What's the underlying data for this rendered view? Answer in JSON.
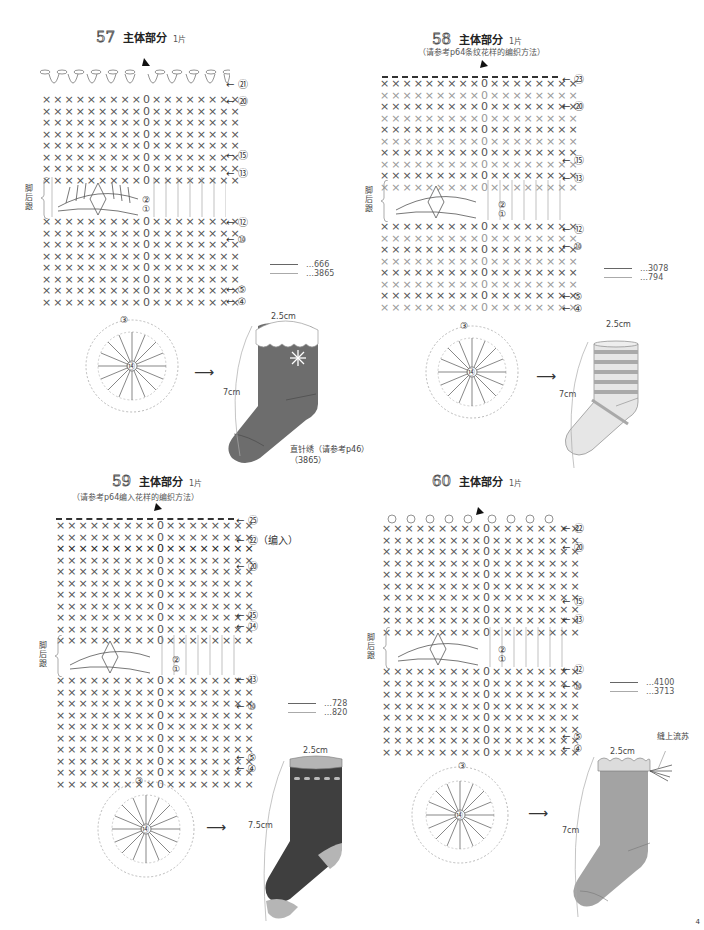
{
  "panels": [
    {
      "id": "57",
      "title": "主体部分",
      "count": "1片",
      "subtitle": "",
      "row_markers": [
        "㉑",
        "⑳",
        "⑮",
        "⑬",
        "⑫",
        "⑩",
        "⑤",
        "④"
      ],
      "heel_label": "脚后跟",
      "heel_rows": [
        "②",
        "①"
      ],
      "legend": [
        {
          "code": "…666"
        },
        {
          "code": "…3865"
        }
      ],
      "sock": {
        "width": "2.5cm",
        "height": "7cm",
        "body_color": "#6d6d6d",
        "cuff_color": "#ffffff",
        "note_line1": "直针绣（请参考p46）",
        "note_line2": "（3865）"
      },
      "circle_center": "⑭",
      "circle_rows": [
        "③",
        "①"
      ]
    },
    {
      "id": "58",
      "title": "主体部分",
      "count": "1片",
      "subtitle": "（请参考p64条纹花样的编织方法）",
      "row_markers": [
        "㉓",
        "⑳",
        "⑮",
        "⑬",
        "⑫",
        "⑩",
        "⑤",
        "④"
      ],
      "heel_label": "脚后跟",
      "heel_rows": [
        "②",
        "①"
      ],
      "legend": [
        {
          "code": "…3078"
        },
        {
          "code": "…794"
        }
      ],
      "sock": {
        "width": "2.5cm",
        "height": "7cm",
        "body_color": "#e6e6e6",
        "stripe_color": "#a9a9a9"
      },
      "circle_center": "⑭",
      "circle_rows": [
        "③",
        "①"
      ]
    },
    {
      "id": "59",
      "title": "主体部分",
      "count": "1片",
      "subtitle": "（请参考p64编入花样的编织方法）",
      "row_markers": [
        "㉕",
        "㉒（编入）",
        "⑳",
        "⑮",
        "⑭",
        "⑬",
        "⑩",
        "⑤",
        "④"
      ],
      "heel_label": "脚后跟",
      "heel_rows": [
        "②",
        "①"
      ],
      "legend": [
        {
          "code": "…728"
        },
        {
          "code": "…820"
        }
      ],
      "sock": {
        "width": "2.5cm",
        "height": "7.5cm",
        "body_color": "#3f3f3f",
        "accent_color": "#b5b5b5"
      },
      "circle_center": "⑭",
      "circle_rows": [
        "③",
        "①"
      ]
    },
    {
      "id": "60",
      "title": "主体部分",
      "count": "1片",
      "subtitle": "",
      "row_markers": [
        "㉒",
        "⑳",
        "⑮",
        "⑬",
        "⑫",
        "⑩",
        "⑤",
        "④"
      ],
      "heel_label": "脚后跟",
      "heel_rows": [
        "②",
        "①"
      ],
      "legend": [
        {
          "code": "…4100"
        },
        {
          "code": "…3713"
        }
      ],
      "sock": {
        "width": "2.5cm",
        "height": "7cm",
        "body_color": "#a3a3a3",
        "cuff_color": "#dcdcdc",
        "tassel_label": "缝上流苏"
      },
      "circle_center": "⑭",
      "circle_rows": [
        "③",
        "①"
      ]
    }
  ],
  "page_number": "4"
}
